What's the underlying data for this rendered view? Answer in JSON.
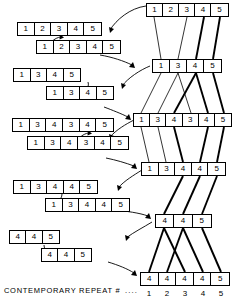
{
  "figure": {
    "caption_label": "CONTEMPORARY  REPEAT  #",
    "leader_dots": "....",
    "ink_color": "#000000",
    "background_color": "#ffffff"
  },
  "left_column": {
    "description": "Pairs of repeat sequences; a curved arrow marks the duplicated unit",
    "pairs": [
      {
        "id": "pair-1",
        "top": {
          "cells": [
            "1",
            "2",
            "3",
            "4",
            "5"
          ],
          "x": 17,
          "y": 22,
          "cell_w": 17,
          "cell_h": 14
        },
        "bottom": {
          "cells": [
            "1",
            "2",
            "3",
            "4",
            "5"
          ],
          "x": 36,
          "y": 40,
          "cell_w": 17,
          "cell_h": 14
        },
        "arrow": {
          "from_cell": 2,
          "to_cell": 3
        }
      },
      {
        "id": "pair-2",
        "top": {
          "cells": [
            "1",
            "3",
            "4",
            "5"
          ],
          "x": 13,
          "y": 68,
          "cell_w": 17,
          "cell_h": 14
        },
        "bottom": {
          "cells": [
            "1",
            "3",
            "4",
            "5"
          ],
          "x": 46,
          "y": 86,
          "cell_w": 17,
          "cell_h": 14
        },
        "arrow": {
          "from_cell": 4,
          "to_cell": 2
        }
      },
      {
        "id": "pair-3",
        "top": {
          "cells": [
            "1",
            "3",
            "4",
            "3",
            "4",
            "5"
          ],
          "x": 12,
          "y": 118,
          "cell_w": 17,
          "cell_h": 14
        },
        "bottom": {
          "cells": [
            "1",
            "3",
            "4",
            "3",
            "4",
            "5"
          ],
          "x": 27,
          "y": 136,
          "cell_w": 17,
          "cell_h": 14
        },
        "arrow": {
          "from_cell": 3,
          "to_cell": 4
        }
      },
      {
        "id": "pair-4",
        "top": {
          "cells": [
            "1",
            "3",
            "4",
            "4",
            "5"
          ],
          "x": 13,
          "y": 180,
          "cell_w": 17,
          "cell_h": 14
        },
        "bottom": {
          "cells": [
            "1",
            "3",
            "4",
            "4",
            "5"
          ],
          "x": 45,
          "y": 198,
          "cell_w": 17,
          "cell_h": 14
        },
        "arrow": {
          "from_cell": 3,
          "to_cell": 1
        }
      },
      {
        "id": "pair-5",
        "top": {
          "cells": [
            "4",
            "4",
            "5"
          ],
          "x": 9,
          "y": 230,
          "cell_w": 17,
          "cell_h": 14
        },
        "bottom": {
          "cells": [
            "4",
            "4",
            "5"
          ],
          "x": 41,
          "y": 248,
          "cell_w": 17,
          "cell_h": 14
        },
        "arrow": {
          "from_cell": 1,
          "to_cell": 2
        }
      }
    ]
  },
  "right_column": {
    "description": "Descent chain of contemporary repeats; thin and thick lines trace unit ancestry",
    "rows": [
      {
        "id": "right-row-1",
        "cells": [
          "1",
          "2",
          "3",
          "4",
          "5"
        ],
        "x": 146,
        "y": 3,
        "cell_w": 16.5,
        "cell_h": 14
      },
      {
        "id": "right-row-2",
        "cells": [
          "1",
          "3",
          "4",
          "5"
        ],
        "x": 152,
        "y": 59,
        "cell_w": 17.5,
        "cell_h": 14
      },
      {
        "id": "right-row-3",
        "cells": [
          "1",
          "3",
          "4",
          "3",
          "4",
          "5"
        ],
        "x": 133,
        "y": 113,
        "cell_w": 16.5,
        "cell_h": 14
      },
      {
        "id": "right-row-4",
        "cells": [
          "1",
          "3",
          "4",
          "4",
          "5"
        ],
        "x": 141,
        "y": 162,
        "cell_w": 17,
        "cell_h": 14
      },
      {
        "id": "right-row-5",
        "cells": [
          "4",
          "4",
          "5"
        ],
        "x": 155,
        "y": 214,
        "cell_w": 19,
        "cell_h": 14
      },
      {
        "id": "right-row-6",
        "cells": [
          "4",
          "4",
          "4",
          "4",
          "5"
        ],
        "x": 140,
        "y": 272,
        "cell_w": 18,
        "cell_h": 14
      }
    ]
  },
  "axis": {
    "label": "CONTEMPORARY  REPEAT  #",
    "dots": "....",
    "ticks": [
      "1",
      "2",
      "3",
      "4",
      "5"
    ],
    "tick_y": 289
  }
}
